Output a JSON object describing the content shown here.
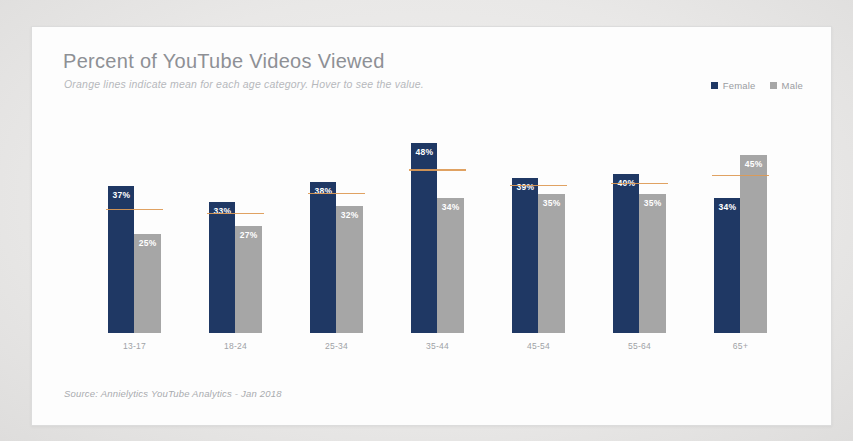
{
  "card": {
    "title": "Percent of YouTube Videos Viewed",
    "subtitle": "Orange lines indicate mean for each age category. Hover to see the value.",
    "source": "Source: Annielytics YouTube Analytics - Jan 2018"
  },
  "legend": {
    "items": [
      {
        "label": "Female",
        "color": "#1f3864",
        "icon": "square-swatch-icon"
      },
      {
        "label": "Male",
        "color": "#a6a6a6",
        "icon": "square-swatch-icon"
      }
    ]
  },
  "colors": {
    "female": "#1f3864",
    "male": "#a6a6a6",
    "mean_line": "#dd9a55",
    "card_background": "#fdfdfd",
    "page_background": "#ededed",
    "title_text": "#8e9095",
    "subtitle_text": "#b6b8bc"
  },
  "chart_data": {
    "type": "bar",
    "title": "Percent of YouTube Videos Viewed",
    "subtitle": "Orange lines indicate mean for each age category. Hover to see the value.",
    "xlabel": "",
    "ylabel": "",
    "ylim": [
      0,
      55
    ],
    "grid": false,
    "legend_position": "top-right",
    "categories": [
      "13-17",
      "18-24",
      "25-34",
      "35-44",
      "45-54",
      "55-64",
      "65+"
    ],
    "series": [
      {
        "name": "Female",
        "color": "#1f3864",
        "values": [
          37,
          33,
          38,
          48,
          39,
          40,
          34
        ],
        "labels": [
          "37%",
          "33%",
          "38%",
          "48%",
          "39%",
          "40%",
          "34%"
        ]
      },
      {
        "name": "Male",
        "color": "#a6a6a6",
        "values": [
          25,
          27,
          32,
          34,
          35,
          35,
          45
        ],
        "labels": [
          "25%",
          "27%",
          "32%",
          "34%",
          "35%",
          "35%",
          "45%"
        ]
      }
    ],
    "mean_lines": {
      "name": "Mean",
      "color": "#dd9a55",
      "values": [
        31,
        30,
        35,
        41,
        37,
        37.5,
        39.5
      ]
    }
  }
}
